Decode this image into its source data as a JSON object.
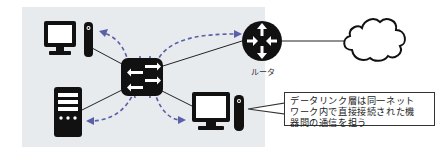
{
  "diagram": {
    "nodes": [
      {
        "id": "pc-top-left",
        "type": "pc",
        "label": ""
      },
      {
        "id": "server-bottom-left",
        "type": "server",
        "label": ""
      },
      {
        "id": "switch",
        "type": "switch",
        "label": ""
      },
      {
        "id": "pc-bottom-right",
        "type": "pc",
        "label": ""
      },
      {
        "id": "router",
        "type": "router",
        "label": "ルータ"
      },
      {
        "id": "cloud",
        "type": "internet",
        "label": ""
      }
    ],
    "links": [
      {
        "from": "pc-top-left",
        "to": "switch"
      },
      {
        "from": "server-bottom-left",
        "to": "switch"
      },
      {
        "from": "pc-bottom-right",
        "to": "switch"
      },
      {
        "from": "router",
        "to": "switch"
      },
      {
        "from": "router",
        "to": "cloud"
      }
    ],
    "flows": [
      {
        "from": "switch",
        "to": "pc-top-left",
        "style": "dashed-arrow"
      },
      {
        "from": "switch",
        "to": "server-bottom-left",
        "style": "dashed-arrow"
      },
      {
        "from": "switch",
        "to": "pc-bottom-right",
        "style": "dashed-arrow"
      },
      {
        "from": "switch",
        "to": "router",
        "style": "dashed-arrow"
      }
    ],
    "router_label": "ルータ",
    "callout": {
      "line1": "データリンク層は同一ネット",
      "line2": "ワーク内で直接接続された機",
      "line3": "器間の通信を担う"
    },
    "colors": {
      "panel_bg": "#e8ebee",
      "device": "#111111",
      "flow_arrow": "#5a5fa8",
      "link_line": "#222222"
    }
  }
}
